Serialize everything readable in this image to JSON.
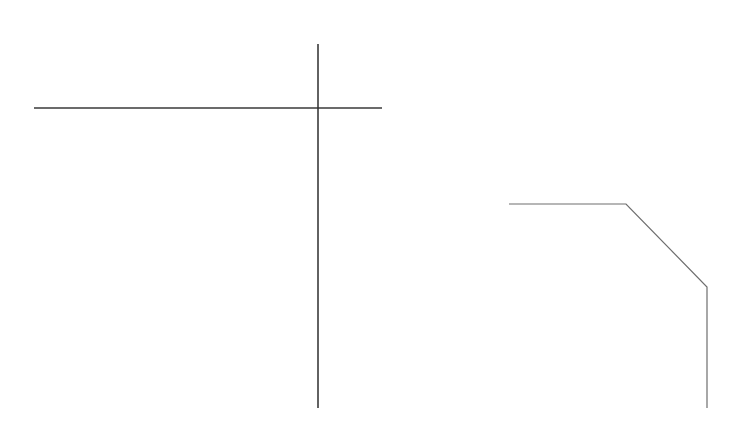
{
  "canvas": {
    "width": 752,
    "height": 427,
    "background": "#ffffff"
  },
  "colors": {
    "stroke_dark": "#3a3a3a",
    "stroke_light": "#6e6e6e"
  },
  "shapes": {
    "horizontal_line": {
      "x1": 34,
      "y1": 108,
      "x2": 382,
      "y2": 108
    },
    "vertical_line": {
      "x1": 318,
      "y1": 44,
      "x2": 318,
      "y2": 408
    },
    "polyline": {
      "points": "509,204 626,204 707,287 707,408"
    }
  }
}
